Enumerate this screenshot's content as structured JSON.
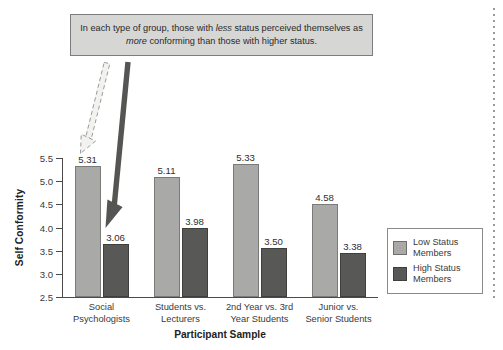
{
  "callout": {
    "text_before_1": "In each type of group, those with ",
    "emphasis_1": "less",
    "text_after_1": " status perceived",
    "text_before_2": "themselves as ",
    "emphasis_2": "more",
    "text_after_2": " conforming than those with higher status."
  },
  "legend": {
    "items": [
      {
        "label_line1": "Low Status",
        "label_line2": "Members",
        "color": "#a9a9a7"
      },
      {
        "label_line1": "High Status",
        "label_line2": "Members",
        "color": "#585856"
      }
    ]
  },
  "annotations": {
    "light_arrow_name": "dashed-arrow-to-low-status-bar",
    "dark_arrow_name": "solid-arrow-to-high-status-bar"
  },
  "chart_data": {
    "type": "bar",
    "title": "",
    "xlabel": "Participant Sample",
    "ylabel": "Self Conformity",
    "ylim": [
      2.5,
      5.5
    ],
    "yticks": [
      "2.5",
      "3.0",
      "3.5",
      "4.0",
      "4.5",
      "5.0",
      "5.5"
    ],
    "grid": false,
    "legend_position": "right",
    "categories": [
      [
        "Social",
        "Psychologists"
      ],
      [
        "Students vs.",
        "Lecturers"
      ],
      [
        "2nd Year vs. 3rd",
        "Year Students"
      ],
      [
        "Junior vs.",
        "Senior Students"
      ]
    ],
    "series": [
      {
        "name": "Low Status Members",
        "color": "#a9a9a7",
        "values": [
          5.31,
          5.11,
          5.33,
          4.58
        ],
        "labels": [
          "5.31",
          "5.11",
          "5.33",
          "4.58"
        ],
        "drawn_heights": [
          5.33,
          5.09,
          5.38,
          4.5
        ]
      },
      {
        "name": "High Status Members",
        "color": "#585856",
        "values": [
          3.06,
          3.98,
          3.5,
          3.38
        ],
        "labels": [
          "3.06",
          "3.98",
          "3.50",
          "3.38"
        ],
        "drawn_heights": [
          3.65,
          4.0,
          3.56,
          3.44
        ]
      }
    ]
  }
}
